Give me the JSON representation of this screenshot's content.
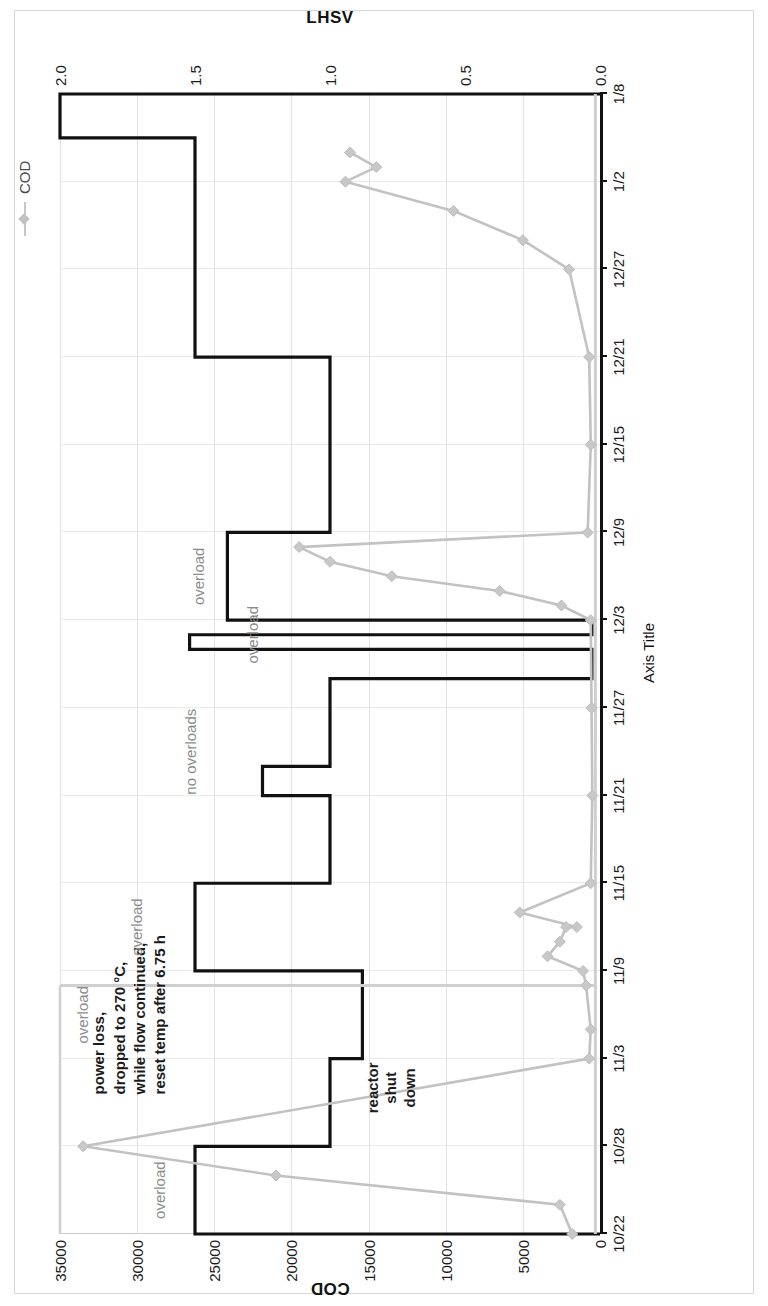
{
  "figure": {
    "orientation": "rotated-90-ccw",
    "background": "#ffffff"
  },
  "legend": {
    "position": "top-right",
    "entries": [
      {
        "label": "COD",
        "color": "#c2c2c2",
        "marker": "diamond"
      }
    ]
  },
  "axes": {
    "x_title": "Axis Title",
    "y_left_title": "COD",
    "y_right_title": "LHSV"
  },
  "annotations": [
    {
      "id": "overload-1",
      "text": "overload",
      "style": "grey"
    },
    {
      "id": "overload-2",
      "text": "overload",
      "style": "grey"
    },
    {
      "id": "powerloss",
      "style": "dark",
      "lines": [
        "power loss,",
        "dropped to 270 °C,",
        "while flow continued,",
        "reset temp after 6.75 h"
      ]
    },
    {
      "id": "no-overloads",
      "text": "no overloads",
      "style": "grey"
    },
    {
      "id": "overload-3",
      "text": "overload",
      "style": "grey"
    },
    {
      "id": "overload-4",
      "text": "overload",
      "style": "grey"
    },
    {
      "id": "overload-5",
      "text": "overload",
      "style": "grey"
    },
    {
      "id": "reactor-shutdown",
      "style": "dark",
      "lines": [
        "reactor",
        "shut",
        "down"
      ]
    }
  ],
  "chart_data": {
    "type": "line",
    "title": "",
    "subtitle": "",
    "xlabel": "Axis Title",
    "ylabel": "COD",
    "y2label": "LHSV",
    "grid": true,
    "legend_position": "top-right",
    "x": [
      "10/22",
      "10/28",
      "11/3",
      "11/9",
      "11/15",
      "11/21",
      "11/27",
      "12/3",
      "12/9",
      "12/15",
      "12/21",
      "12/27",
      "1/2",
      "1/8"
    ],
    "x_tick_labels": [
      "10/22",
      "10/28",
      "11/3",
      "11/9",
      "11/15",
      "11/21",
      "11/27",
      "12/3",
      "12/9",
      "12/15",
      "12/21",
      "12/27",
      "1/2",
      "1/8"
    ],
    "ylim": [
      0,
      35000
    ],
    "y_tick_labels": [
      "0",
      "5000",
      "10000",
      "15000",
      "20000",
      "25000",
      "30000",
      "35000"
    ],
    "y2lim": [
      0,
      2.0
    ],
    "y2_tick_labels": [
      "0.0",
      "0.5",
      "1.0",
      "1.5",
      "2.0"
    ],
    "series": [
      {
        "name": "COD",
        "axis": "left",
        "color": "#c2c2c2",
        "marker": "diamond",
        "units": "mg/L",
        "points": [
          {
            "date": "10/22",
            "value": 1800
          },
          {
            "date": "10/24",
            "value": 2600
          },
          {
            "date": "10/26",
            "value": 21000
          },
          {
            "date": "10/28",
            "value": 33500
          },
          {
            "date": "11/3",
            "value": 700
          },
          {
            "date": "11/5",
            "value": 600
          },
          {
            "date": "11/8",
            "value": 900
          },
          {
            "date": "11/9",
            "value": 1100
          },
          {
            "date": "11/10",
            "value": 3400
          },
          {
            "date": "11/11",
            "value": 2600
          },
          {
            "date": "11/12",
            "value": 2200
          },
          {
            "date": "11/12",
            "value": 1500
          },
          {
            "date": "11/13",
            "value": 5200
          },
          {
            "date": "11/15",
            "value": 600
          },
          {
            "date": "11/21",
            "value": 500
          },
          {
            "date": "11/27",
            "value": 550
          },
          {
            "date": "12/3",
            "value": 600
          },
          {
            "date": "12/4",
            "value": 2500
          },
          {
            "date": "12/5",
            "value": 6500
          },
          {
            "date": "12/6",
            "value": 13500
          },
          {
            "date": "12/7",
            "value": 17500
          },
          {
            "date": "12/8",
            "value": 19500
          },
          {
            "date": "12/9",
            "value": 800
          },
          {
            "date": "12/15",
            "value": 600
          },
          {
            "date": "12/21",
            "value": 700
          },
          {
            "date": "12/27",
            "value": 2000
          },
          {
            "date": "12/29",
            "value": 5000
          },
          {
            "date": "12/31",
            "value": 9500
          },
          {
            "date": "1/2",
            "value": 16500
          },
          {
            "date": "1/3",
            "value": 14500
          },
          {
            "date": "1/4",
            "value": 16200
          }
        ],
        "note": "A flat near-zero gray baseline trace is also drawn across the full x-range; a tall spike reaching ~35000 occurs just before 11/9."
      },
      {
        "name": "LHSV",
        "axis": "right",
        "color": "#111111",
        "style": "step",
        "steps": [
          {
            "from": "10/22",
            "to": "10/28",
            "value": 1.5
          },
          {
            "from": "10/28",
            "to": "11/3",
            "value": 1.0
          },
          {
            "from": "11/3",
            "to": "11/9",
            "value": 0.88
          },
          {
            "from": "11/9",
            "to": "11/15",
            "value": 1.5
          },
          {
            "from": "11/15",
            "to": "11/21",
            "value": 1.0
          },
          {
            "from": "11/21",
            "to": "11/23",
            "value": 1.25
          },
          {
            "from": "11/23",
            "to": "11/29",
            "value": 1.0
          },
          {
            "from": "11/29",
            "to": "12/1",
            "value": 0.03
          },
          {
            "from": "12/1",
            "to": "12/2",
            "value": 1.52
          },
          {
            "from": "12/2",
            "to": "12/3",
            "value": 0.03
          },
          {
            "from": "12/3",
            "to": "12/9",
            "value": 1.38
          },
          {
            "from": "12/9",
            "to": "12/21",
            "value": 1.0
          },
          {
            "from": "12/21",
            "to": "1/5",
            "value": 1.5
          },
          {
            "from": "1/5",
            "to": "1/8",
            "value": 2.0
          }
        ]
      }
    ]
  }
}
